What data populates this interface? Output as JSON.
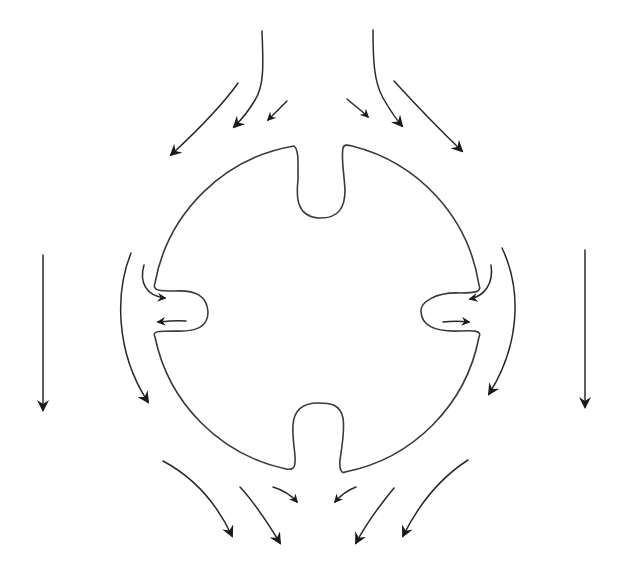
{
  "diagram": {
    "type": "flow-around-notched-circle",
    "colors": {
      "background": "#ffffff",
      "outline": "#3a3a3a",
      "arrow": "#2a2a2a"
    },
    "body": {
      "shape": "circle",
      "center": [
        318,
        310
      ],
      "radius": 170,
      "notches": [
        "top",
        "right",
        "bottom",
        "left"
      ]
    },
    "arrows": {
      "top_streams": 6,
      "side_streams": 4,
      "notch_circulation": 4,
      "free_stream": 2,
      "bottom_streams": 6
    }
  }
}
